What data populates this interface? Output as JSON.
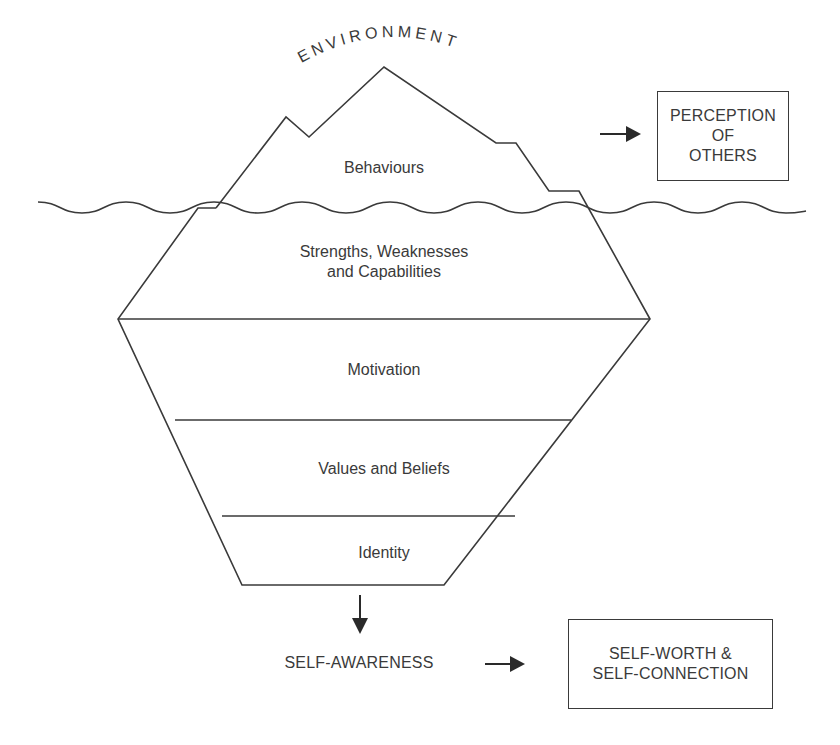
{
  "diagram": {
    "type": "iceberg",
    "arc_label": "ENVIRONMENT",
    "layers": [
      {
        "id": "behaviours",
        "label": "Behaviours",
        "zone": "above-water"
      },
      {
        "id": "strengths",
        "label": "Strengths, Weaknesses\nand Capabilities",
        "zone": "below-water"
      },
      {
        "id": "motivation",
        "label": "Motivation",
        "zone": "below-water"
      },
      {
        "id": "values",
        "label": "Values and Beliefs",
        "zone": "below-water"
      },
      {
        "id": "identity",
        "label": "Identity",
        "zone": "below-water"
      }
    ],
    "outputs": {
      "above": {
        "box_label": "PERCEPTION\nOF\nOTHERS"
      },
      "below": {
        "intermediate_label": "SELF-AWARENESS",
        "box_label": "SELF-WORTH &\nSELF-CONNECTION"
      }
    },
    "colors": {
      "stroke": "#3a3a3a",
      "background": "#ffffff",
      "text": "#3a3a3a"
    }
  }
}
